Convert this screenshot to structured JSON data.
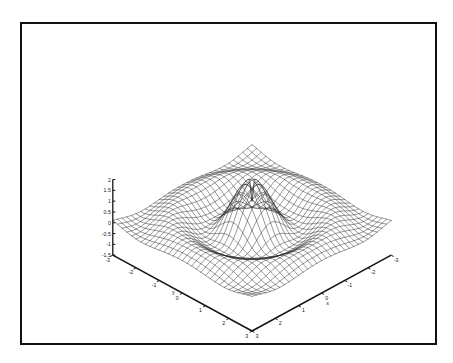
{
  "figure": {
    "background_color": "#ffffff",
    "border_color": "#111111",
    "line_color": "#1a1a1a",
    "title": "",
    "caption": ""
  },
  "chart_data": {
    "type": "surface",
    "render_style": "wireframe-mesh",
    "title": "",
    "subtitle": "",
    "xlabel": "x",
    "ylabel": "y",
    "zlabel": "",
    "function": "sin(sqrt(x^2+y^2)*pi)/(sqrt(x^2+y^2)*pi) style radial ripple",
    "xlim": [
      -3,
      3
    ],
    "ylim": [
      -3,
      3
    ],
    "zlim": [
      -1.5,
      2
    ],
    "grid": false,
    "legend": "none",
    "mesh_resolution": {
      "nx": 31,
      "ny": 31
    },
    "x_ticks": [
      3,
      2,
      1,
      0,
      -1,
      -2,
      -3
    ],
    "x_tick_labels": [
      "3",
      "2",
      "1",
      "0",
      "-1",
      "-2",
      "-3"
    ],
    "y_ticks": [
      -3,
      -2,
      -1,
      0,
      1,
      2,
      3
    ],
    "y_tick_labels": [
      "-3",
      "-2",
      "-1",
      "0",
      "1",
      "2",
      "3"
    ],
    "z_ticks": [
      2,
      1.5,
      1,
      0.5,
      0,
      -0.5,
      -1,
      -1.5
    ],
    "z_tick_labels": [
      "2",
      "1.5",
      "1",
      "0.5",
      "0",
      "-0.5",
      "-1",
      "-1.5"
    ],
    "view": {
      "azimuth": -45,
      "elevation": 22
    }
  },
  "axes": {
    "x": {
      "label": "x",
      "ticks": [
        "3",
        "2",
        "1",
        "0",
        "-1",
        "-2",
        "-3"
      ]
    },
    "y": {
      "label": "y",
      "ticks": [
        "-3",
        "-2",
        "-1",
        "0",
        "1",
        "2",
        "3"
      ]
    },
    "z": {
      "label": "",
      "ticks": [
        "2",
        "1.5",
        "1",
        "0.5",
        "0",
        "-0.5",
        "-1",
        "-1.5"
      ]
    }
  }
}
